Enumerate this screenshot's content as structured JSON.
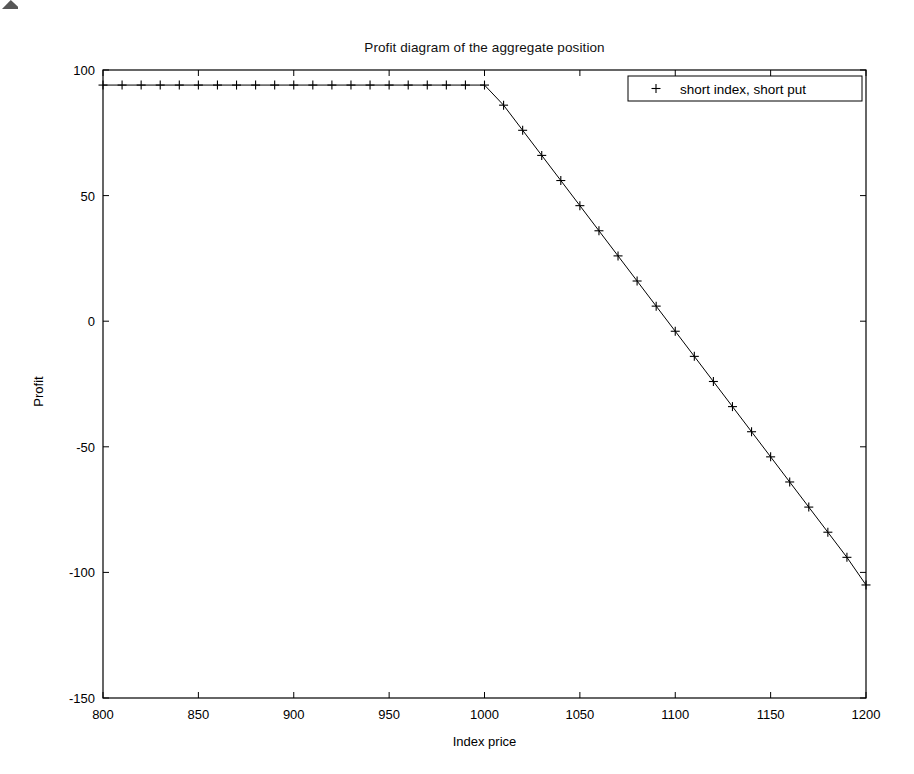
{
  "chart_data": {
    "type": "line",
    "title": "Profit diagram of the aggregate position",
    "xlabel": "Index price",
    "ylabel": "Profit",
    "xlim": [
      800,
      1200
    ],
    "ylim": [
      -150,
      100
    ],
    "xticks": [
      800,
      850,
      900,
      950,
      1000,
      1050,
      1100,
      1150,
      1200
    ],
    "yticks": [
      100,
      50,
      0,
      -50,
      -100,
      -150
    ],
    "grid": false,
    "legend_position": "upper right",
    "marker": "+",
    "line_color": "#000000",
    "series": [
      {
        "name": "short index, short put",
        "marker": "+",
        "x": [
          800,
          810,
          820,
          830,
          840,
          850,
          860,
          870,
          880,
          890,
          900,
          910,
          920,
          930,
          940,
          950,
          960,
          970,
          980,
          990,
          1000,
          1010,
          1020,
          1030,
          1040,
          1050,
          1060,
          1070,
          1080,
          1090,
          1100,
          1110,
          1120,
          1130,
          1140,
          1150,
          1160,
          1170,
          1180,
          1190,
          1200
        ],
        "values": [
          94,
          94,
          94,
          94,
          94,
          94,
          94,
          94,
          94,
          94,
          94,
          94,
          94,
          94,
          94,
          94,
          94,
          94,
          94,
          94,
          94,
          86,
          76,
          66,
          56,
          46,
          36,
          26,
          16,
          6,
          -4,
          -14,
          -24,
          -34,
          -44,
          -54,
          -64,
          -74,
          -84,
          -94,
          -105
        ]
      }
    ],
    "annotations": [
      "Flat at profit 94 for index price at or below 1000 (option expires worthless region)",
      "Linear decline with slope approximately -1 for index price above 1000",
      "Breakpoint at index price 1000"
    ]
  },
  "legend": {
    "entries": [
      {
        "label": "short index, short put",
        "marker": "+"
      }
    ]
  },
  "axes": {
    "x_tick_labels": [
      "800",
      "850",
      "900",
      "950",
      "1000",
      "1050",
      "1100",
      "1150",
      "1200"
    ],
    "y_tick_labels": [
      "100",
      "50",
      "0",
      "-50",
      "-100",
      "-150"
    ]
  }
}
